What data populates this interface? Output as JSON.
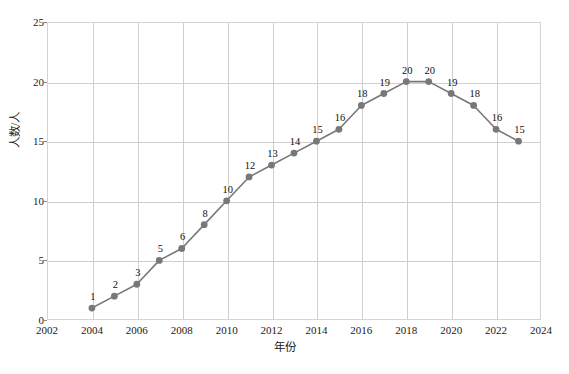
{
  "chart_data": {
    "type": "line",
    "title": "",
    "xlabel": "年份",
    "ylabel": "人数/人",
    "x": [
      2004,
      2005,
      2006,
      2007,
      2008,
      2009,
      2010,
      2011,
      2012,
      2013,
      2014,
      2015,
      2016,
      2017,
      2018,
      2019,
      2020,
      2021,
      2022,
      2023
    ],
    "values": [
      1,
      2,
      3,
      5,
      6,
      8,
      10,
      12,
      13,
      14,
      15,
      16,
      18,
      19,
      20,
      20,
      19,
      18,
      16,
      15
    ],
    "point_labels": [
      "1",
      "2",
      "3",
      "5",
      "6",
      "8",
      "10",
      "12",
      "13",
      "14",
      "15",
      "16",
      "18",
      "19",
      "20",
      "20",
      "19",
      "18",
      "16",
      "15"
    ],
    "xlim": [
      2002,
      2024
    ],
    "ylim": [
      0,
      25
    ],
    "xticks": [
      2002,
      2004,
      2006,
      2008,
      2010,
      2012,
      2014,
      2016,
      2018,
      2020,
      2022,
      2024
    ],
    "xtick_labels": [
      "2002",
      "2004",
      "2006",
      "2008",
      "2010",
      "2012",
      "2014",
      "2016",
      "2018",
      "2020",
      "2022",
      "2024"
    ],
    "yticks": [
      0,
      5,
      10,
      15,
      20,
      25
    ],
    "ytick_labels": [
      "0",
      "5",
      "10",
      "15",
      "20",
      "25"
    ],
    "grid": true,
    "legend": false,
    "series_color": "#787878",
    "marker_color": "#787878",
    "grid_color": "#cfcfcf",
    "frame_color": "#d4d4d4"
  },
  "caption": {
    "text": ""
  }
}
